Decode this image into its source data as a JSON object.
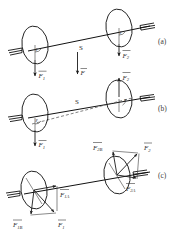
{
  "figure": {
    "panels": [
      {
        "id": "a",
        "label": "(a)",
        "angle_symbol_left": "ε",
        "angle_symbol_right": "ε",
        "vectors": [
          {
            "name": "F1",
            "base": "F",
            "sub": "1"
          },
          {
            "name": "F2",
            "base": "F",
            "sub": "2"
          }
        ],
        "center_labels": {
          "separation": "S",
          "force": "F"
        }
      },
      {
        "id": "b",
        "label": "(b)",
        "angle_symbol_left": "ε",
        "angle_symbol_right": "ε",
        "vectors": [
          {
            "name": "F1",
            "base": "F",
            "sub": "1"
          },
          {
            "name": "F2",
            "base": "F",
            "sub": "2"
          }
        ],
        "center_labels": {
          "separation": "S"
        }
      },
      {
        "id": "c",
        "label": "(c)",
        "vectors": [
          {
            "name": "F1A",
            "base": "F",
            "sub": "1A"
          },
          {
            "name": "F1B",
            "base": "F",
            "sub": "1B"
          },
          {
            "name": "F1",
            "base": "F",
            "sub": "1"
          },
          {
            "name": "F2A",
            "base": "F",
            "sub": "2A"
          },
          {
            "name": "F2B",
            "base": "F",
            "sub": "2B"
          },
          {
            "name": "F2",
            "base": "F",
            "sub": "2"
          }
        ]
      }
    ],
    "colors": {
      "stroke": "#1a1a1a",
      "label": "#2b2b2b",
      "panel_label": "#404040",
      "dashed": "#4a4a4a",
      "background": "#ffffff"
    }
  }
}
